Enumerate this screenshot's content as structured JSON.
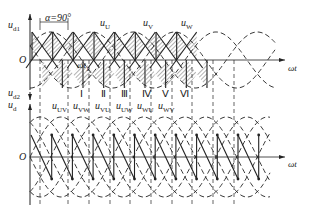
{
  "diagram": {
    "title_fragment": "",
    "top_panel": {
      "y_axis_label": "u",
      "y_axis_sub": "d1",
      "origin_label": "O",
      "x_axis_label": "ωt",
      "alpha_label": "α=90°",
      "omega_t1_label": "ωt",
      "omega_t1_sub": "1",
      "phase_labels": [
        {
          "base": "u",
          "sub": "U"
        },
        {
          "base": "u",
          "sub": "V"
        },
        {
          "base": "u",
          "sub": "W"
        }
      ]
    },
    "middle_labels": {
      "ud2_base": "u",
      "ud2_sub": "d2",
      "ud_base": "u",
      "ud_sub": "d",
      "line_voltages": [
        {
          "base": "u",
          "sub": "UV"
        },
        {
          "base": "u",
          "sub": "VW"
        },
        {
          "base": "u",
          "sub": "VU"
        },
        {
          "base": "u",
          "sub": "UW"
        },
        {
          "base": "u",
          "sub": "WU"
        },
        {
          "base": "u",
          "sub": "WV"
        }
      ],
      "intervals": [
        "Ⅰ",
        "Ⅱ",
        "Ⅲ",
        "Ⅳ",
        "Ⅴ",
        "Ⅵ"
      ]
    },
    "bottom_panel": {
      "origin_label": "O",
      "x_axis_label": "ωt"
    },
    "colors": {
      "stroke": "#222222",
      "background": "#ffffff"
    }
  }
}
